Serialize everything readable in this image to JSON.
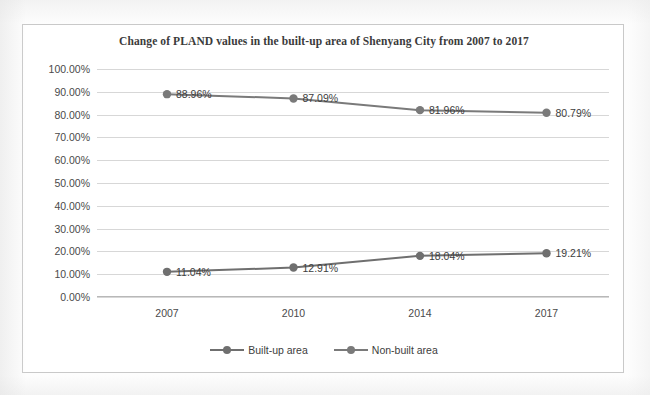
{
  "chart_data": {
    "type": "line",
    "title": "Change of PLAND values in the built-up area of Shenyang City from 2007 to 2017",
    "xlabel": "",
    "ylabel": "",
    "categories": [
      "2007",
      "2010",
      "2014",
      "2017"
    ],
    "series": [
      {
        "name": "Built-up area",
        "color": "#6f6f6f",
        "values": [
          11.04,
          12.91,
          18.04,
          19.21
        ],
        "labels": [
          "11.04%",
          "12.91%",
          "18.04%",
          "19.21%"
        ]
      },
      {
        "name": "Non-built area",
        "color": "#7a7a7a",
        "values": [
          88.96,
          87.09,
          81.96,
          80.79
        ],
        "labels": [
          "88.96%",
          "87.09%",
          "81.96%",
          "80.79%"
        ]
      }
    ],
    "ylim": [
      0,
      100
    ],
    "ytick_values": [
      100,
      90,
      80,
      70,
      60,
      50,
      40,
      30,
      20,
      10,
      0
    ],
    "ytick_labels": [
      "100.00%",
      "90.00%",
      "80.00%",
      "70.00%",
      "60.00%",
      "50.00%",
      "40.00%",
      "30.00%",
      "20.00%",
      "10.00%",
      "0.00%"
    ],
    "grid": true,
    "legend_position": "bottom",
    "colors": {
      "gridline": "#d7d7d7",
      "text": "#4a4a4a",
      "frame_border": "#c9c9c9",
      "page_background": "#fdfdfd",
      "plot_background": "#ffffff"
    }
  }
}
